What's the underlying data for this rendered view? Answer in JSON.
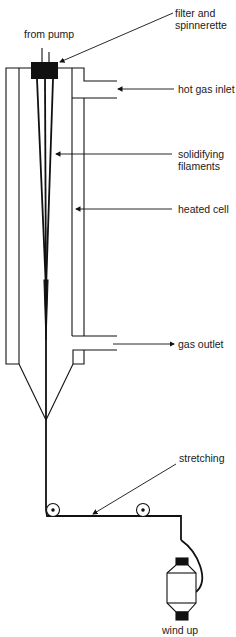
{
  "diagram": {
    "type": "melt spinning apparatus schematic",
    "labels": {
      "from_pump": "from pump",
      "filter_line1": "filter and",
      "filter_line2": "spinnerette",
      "hot_gas_inlet": "hot gas inlet",
      "solidifying_line1": "solidifying",
      "solidifying_line2": "filaments",
      "heated_cell": "heated cell",
      "gas_outlet": "gas outlet",
      "stretching": "stretching",
      "wind_up": "wind up"
    },
    "colors": {
      "line": "#111111",
      "background": "#ffffff"
    }
  }
}
